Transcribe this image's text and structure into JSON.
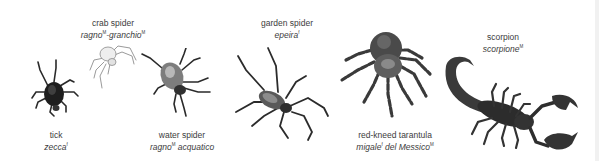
{
  "entries": [
    {
      "id": "tick",
      "english": "tick",
      "italian_parts": [
        {
          "text": "zecca",
          "gender": "f"
        }
      ]
    },
    {
      "id": "crab-spider",
      "english": "crab spider",
      "italian_parts": [
        {
          "text": "ragno",
          "gender": "M"
        },
        {
          "text": "-granchio",
          "gender": "M"
        }
      ]
    },
    {
      "id": "water-spider",
      "english": "water spider",
      "italian_parts": [
        {
          "text": "ragno",
          "gender": "M"
        },
        {
          "text": " acquatico",
          "gender": ""
        }
      ]
    },
    {
      "id": "garden-spider",
      "english": "garden spider",
      "italian_parts": [
        {
          "text": "epeira",
          "gender": "f"
        }
      ]
    },
    {
      "id": "red-kneed-tarantula",
      "english": "red-kneed tarantula",
      "italian_parts": [
        {
          "text": "migale",
          "gender": "f"
        },
        {
          "text": " del Messico",
          "gender": "M"
        }
      ]
    },
    {
      "id": "scorpion",
      "english": "scorpion",
      "italian_parts": [
        {
          "text": "scorpione",
          "gender": "M"
        }
      ]
    }
  ],
  "icons": {
    "tick": "tick-illustration",
    "crab-spider": "crab-spider-illustration",
    "water-spider": "water-spider-illustration",
    "garden-spider": "garden-spider-illustration",
    "red-kneed-tarantula": "tarantula-illustration",
    "scorpion": "scorpion-illustration"
  },
  "colors": {
    "background": "#ffffff",
    "text": "#3c3c3c",
    "ink_dark": "#222222",
    "ink_mid": "#555555",
    "ink_light": "#bdbdbd"
  }
}
